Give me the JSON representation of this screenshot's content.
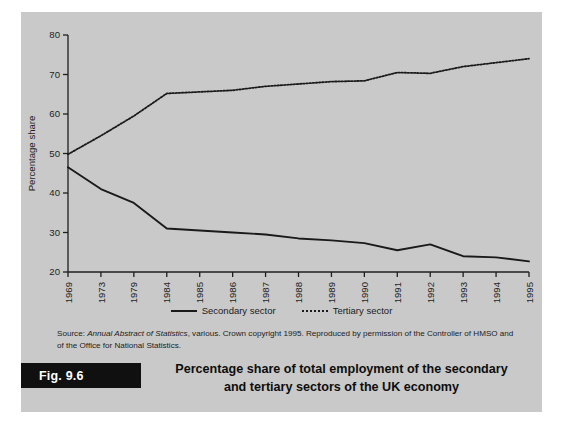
{
  "figure": {
    "tag": "Fig. 9.6",
    "caption_line1": "Percentage share of total employment of the secondary",
    "caption_line2": "and tertiary sectors of the UK economy",
    "caption_full": "Percentage share of total employment of the secondary and tertiary sectors of the UK economy"
  },
  "source": {
    "prefix": "Source: ",
    "italic_title": "Annual Abstract of Statistics",
    "rest": ", various. Crown copyright 1995. Reproduced by permission of the Controller of HMSO and of the Office for National Statistics."
  },
  "legend": {
    "items": [
      {
        "label": "Secondary sector",
        "style": "solid",
        "color": "#1a1a1a"
      },
      {
        "label": "Tertiary sector",
        "style": "dotted",
        "color": "#1a1a1a"
      }
    ]
  },
  "colors": {
    "panel_background": "#c9c9c9",
    "page_background": "#ffffff",
    "line": "#1a1a1a",
    "axis": "#1e1e1e",
    "caption_tag_background": "#101010",
    "caption_tag_text": "#ffffff"
  },
  "chart_data": {
    "type": "line",
    "title": "Percentage share of total employment of the secondary and tertiary sectors of the UK economy",
    "xlabel": "",
    "ylabel": "Percentage share",
    "categories": [
      "1969",
      "1973",
      "1979",
      "1984",
      "1985",
      "1986",
      "1987",
      "1988",
      "1989",
      "1990",
      "1991",
      "1992",
      "1993",
      "1994",
      "1995"
    ],
    "ylim": [
      20,
      80
    ],
    "yticks": [
      20,
      30,
      40,
      50,
      60,
      70,
      80
    ],
    "grid": false,
    "legend_position": "bottom",
    "series": [
      {
        "name": "Secondary sector",
        "style": "solid",
        "color": "#1a1a1a",
        "values": [
          46.5,
          41.0,
          37.5,
          31.0,
          30.5,
          30.0,
          29.5,
          28.5,
          28.0,
          27.3,
          25.5,
          27.0,
          24.0,
          23.7,
          22.7
        ]
      },
      {
        "name": "Tertiary sector",
        "style": "dotted",
        "color": "#1a1a1a",
        "values": [
          49.8,
          54.5,
          59.5,
          65.2,
          65.6,
          66.0,
          67.0,
          67.6,
          68.2,
          68.4,
          70.5,
          70.3,
          72.0,
          73.0,
          74.0
        ]
      }
    ]
  }
}
